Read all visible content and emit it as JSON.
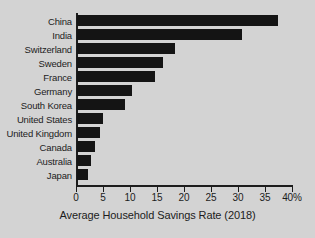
{
  "chart_data": {
    "type": "bar",
    "orientation": "horizontal",
    "title": "",
    "xlabel": "Average Household Savings Rate (2018)",
    "ylabel": "",
    "categories": [
      "China",
      "India",
      "Switzerland",
      "Sweden",
      "France",
      "Germany",
      "South Korea",
      "United States",
      "United Kingdom",
      "Canada",
      "Australia",
      "Japan"
    ],
    "values": [
      37.2,
      30.5,
      18.2,
      16.0,
      14.4,
      10.2,
      8.9,
      4.9,
      4.3,
      3.4,
      2.6,
      2.1
    ],
    "xlim": [
      0,
      40
    ],
    "xticks": [
      0,
      5,
      10,
      15,
      20,
      25,
      30,
      35,
      40
    ],
    "xtick_labels": [
      "0",
      "5",
      "10",
      "15",
      "20",
      "25",
      "30",
      "35",
      "40%"
    ],
    "grid": false,
    "legend": false,
    "bar_color": "#141414",
    "background_color": "#d3d3d3",
    "axis_color": "#1c1c1c"
  }
}
